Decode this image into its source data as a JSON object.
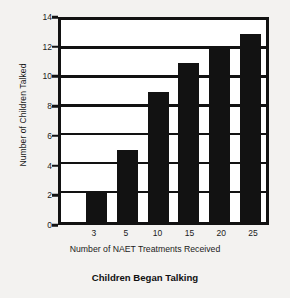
{
  "chart_data": {
    "type": "bar",
    "title": "Children Began Talking",
    "xlabel": "Number of NAET Treatments Received",
    "ylabel": "Number of Children Talked",
    "categories": [
      "3",
      "5",
      "10",
      "15",
      "20",
      "25"
    ],
    "values": [
      2,
      5,
      9,
      11,
      12,
      13
    ],
    "yticks": [
      0,
      2,
      4,
      6,
      8,
      10,
      12,
      14
    ],
    "ylim": [
      0,
      14
    ],
    "grid": "horizontal",
    "legend": "none",
    "bar_color": "#121212",
    "background_color": "#f3f2f0",
    "plot_background_color": "#ffffff",
    "axis_color": "#121212"
  }
}
